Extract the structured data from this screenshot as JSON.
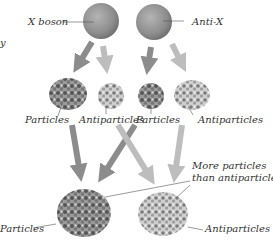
{
  "diagram": {
    "top": {
      "x_boson_label": "X boson",
      "anti_x_label": "Anti-X"
    },
    "middle": {
      "particles_left": "Particles",
      "antiparticles_left": "Antiparticles",
      "particles_right": "Particles",
      "antiparticles_right": "Antiparticles"
    },
    "bottom": {
      "particles": "Particles",
      "antiparticles": "Antiparticles",
      "note_line1": "More particles",
      "note_line2": "than antiparticles"
    },
    "edge_fragment": "y"
  },
  "colors": {
    "sphere": "#8a8a8a",
    "arrow_dark": "#8c8c8c",
    "arrow_light": "#bdbdbd",
    "text": "#333333"
  }
}
